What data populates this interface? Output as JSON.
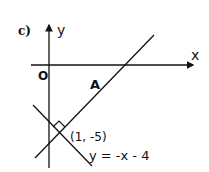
{
  "part_label": "c)",
  "axes": {
    "x_label": "x",
    "y_label": "y",
    "origin_label": "O"
  },
  "lines": [
    {
      "name": "A",
      "label": "A"
    },
    {
      "name": "perpendicular",
      "equation": "y = -x - 4"
    }
  ],
  "intersection": {
    "label": "(1, -5)"
  },
  "colors": {
    "stroke": "#111111",
    "background": "#ffffff"
  }
}
